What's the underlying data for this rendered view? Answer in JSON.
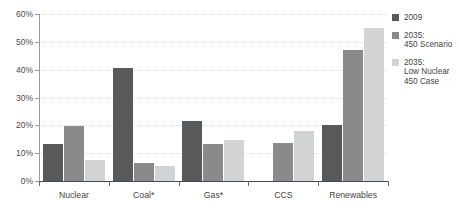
{
  "chart_data": {
    "type": "bar",
    "title": "and Low Nuclear 450 Case",
    "xlabel": "",
    "ylabel": "",
    "ylim": [
      0,
      60
    ],
    "ytick_labels": [
      "0%",
      "10%",
      "20%",
      "30%",
      "40%",
      "50%",
      "60%"
    ],
    "ytick_values": [
      0,
      10,
      20,
      30,
      40,
      50,
      60
    ],
    "grid": true,
    "legend_position": "right",
    "categories": [
      "Nuclear",
      "Coal*",
      "Gas*",
      "CCS",
      "Renewables"
    ],
    "series": [
      {
        "name": "2009",
        "color": "#58595b",
        "values": [
          13.3,
          40.6,
          21.5,
          0,
          20.0
        ]
      },
      {
        "name": "2035: 450 Scenario",
        "color": "#8a8a8c",
        "values": [
          19.9,
          6.3,
          13.2,
          13.6,
          47.0
        ]
      },
      {
        "name": "2035: Low Nuclear 450 Case",
        "color": "#d2d3d4",
        "values": [
          7.5,
          5.3,
          14.6,
          18.0,
          55.0
        ]
      }
    ],
    "legend_entries": [
      {
        "lines": [
          "2009"
        ]
      },
      {
        "lines": [
          "2035:",
          "450 Scenario"
        ]
      },
      {
        "lines": [
          "2035:",
          "Low Nuclear",
          "450 Case"
        ]
      }
    ]
  }
}
